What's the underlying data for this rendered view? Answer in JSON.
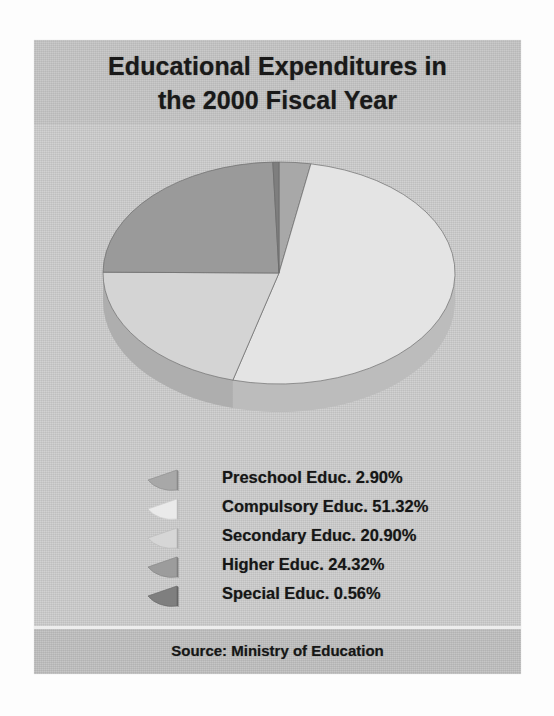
{
  "document": {
    "title_line_1": "Educational Expenditures in",
    "title_line_2": "the 2000 Fiscal Year",
    "source_note": "Source: Ministry of Education",
    "panel_background": "#cccccc",
    "title_band_background": "#c5c5c5",
    "footer_band_background": "#c0c0c0"
  },
  "chart_data": {
    "type": "pie",
    "title": "Educational Expenditures in the 2000 Fiscal Year",
    "subtitle": "",
    "xlabel": "",
    "ylabel": "",
    "grid": false,
    "legend_position": "below-chart",
    "three_d": true,
    "units": "percent",
    "total": 100.0,
    "start_angle_deg": 0,
    "direction": "clockwise",
    "labels": [
      "Preschool Educ.",
      "Compulsory Educ.",
      "Secondary Educ.",
      "Higher Educ.",
      "Special Educ."
    ],
    "values": [
      2.9,
      51.32,
      20.9,
      24.32,
      0.56
    ],
    "value_strings": [
      "2.90%",
      "51.32%",
      "20.90%",
      "24.32%",
      "0.56%"
    ],
    "colors": [
      "#a8a8a8",
      "#e4e4e4",
      "#d4d4d4",
      "#9a9a9a",
      "#7e7e7e"
    ],
    "side_colors": [
      "#8e8e8e",
      "#bcbcbc",
      "#aeaeae",
      "#848484",
      "#6a6a6a"
    ],
    "slices": [
      {
        "label": "Preschool Educ.",
        "value": 2.9,
        "value_text": "2.90%",
        "color": "#a8a8a8"
      },
      {
        "label": "Compulsory Educ.",
        "value": 51.32,
        "value_text": "51.32%",
        "color": "#e4e4e4"
      },
      {
        "label": "Secondary Educ.",
        "value": 20.9,
        "value_text": "20.90%",
        "color": "#d4d4d4"
      },
      {
        "label": "Higher Educ.",
        "value": 24.32,
        "value_text": "24.32%",
        "color": "#9a9a9a"
      },
      {
        "label": "Special Educ.",
        "value": 0.56,
        "value_text": "0.56%",
        "color": "#7e7e7e"
      }
    ]
  },
  "legend": {
    "items": [
      {
        "text": "Preschool Educ. 2.90%",
        "color": "#a8a8a8"
      },
      {
        "text": "Compulsory Educ. 51.32%",
        "color": "#e8e8e8"
      },
      {
        "text": "Secondary Educ. 20.90%",
        "color": "#d6d6d6"
      },
      {
        "text": "Higher Educ. 24.32%",
        "color": "#9c9c9c"
      },
      {
        "text": "Special Educ. 0.56%",
        "color": "#7f7f7f"
      }
    ]
  }
}
